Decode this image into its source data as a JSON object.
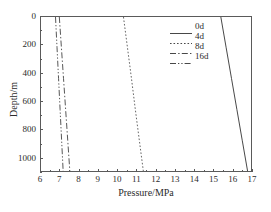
{
  "chart_data": {
    "type": "line",
    "title": "",
    "xlabel": "Pressure/MPa",
    "ylabel": "Depth/m",
    "xlim": [
      6,
      17
    ],
    "ylim": [
      0,
      1100
    ],
    "y_inverted": true,
    "grid": false,
    "legend_position": "upper right",
    "xticks": [
      6,
      7,
      8,
      9,
      10,
      11,
      12,
      13,
      14,
      15,
      16,
      17
    ],
    "xticklabels": [
      "6",
      "7",
      "8",
      "9",
      "10",
      "11",
      "12",
      "13",
      "14",
      "15",
      "16",
      "17"
    ],
    "yticks": [
      0,
      200,
      400,
      600,
      800,
      1000
    ],
    "yticklabels": [
      "0",
      "200",
      "400",
      "600",
      "800",
      "1000"
    ],
    "x_minor_ticks": [
      6.5,
      7.5,
      8.5,
      9.5,
      10.5,
      11.5,
      12.5,
      13.5,
      14.5,
      15.5,
      16.5
    ],
    "y_minor_ticks": [
      100,
      300,
      500,
      700,
      900,
      1100
    ],
    "series": [
      {
        "name": "0d",
        "style": "solid",
        "color": "#333333",
        "x": [
          15.42,
          15.7,
          15.98,
          16.26,
          16.54,
          16.82
        ],
        "y": [
          0,
          220,
          440,
          660,
          880,
          1100
        ]
      },
      {
        "name": "4d",
        "style": "dotted",
        "color": "#555555",
        "x": [
          10.32,
          10.53,
          10.74,
          10.94,
          11.15,
          11.36
        ],
        "y": [
          0,
          220,
          440,
          660,
          880,
          1100
        ]
      },
      {
        "name": "8d",
        "style": "dashdot",
        "color": "#444444",
        "x": [
          6.96,
          7.07,
          7.18,
          7.29,
          7.4,
          7.51
        ],
        "y": [
          0,
          220,
          440,
          660,
          880,
          1100
        ]
      },
      {
        "name": "16d",
        "style": "dashdotdot",
        "color": "#444444",
        "x": [
          6.76,
          6.84,
          6.92,
          7.0,
          7.08,
          7.16
        ],
        "y": [
          0,
          220,
          440,
          660,
          880,
          1100
        ]
      }
    ]
  },
  "legend": {
    "items": [
      {
        "label": "0d",
        "style": "solid"
      },
      {
        "label": "4d",
        "style": "dotted"
      },
      {
        "label": "8d",
        "style": "dashdot"
      },
      {
        "label": "16d",
        "style": "dashdotdot"
      }
    ]
  }
}
